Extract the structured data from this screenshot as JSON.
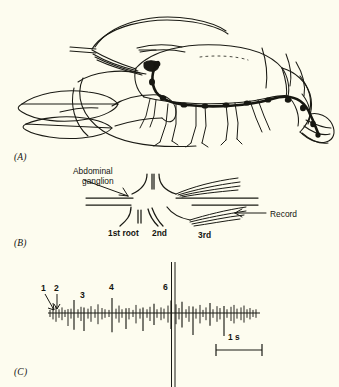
{
  "figure": {
    "background_color": "#fdfcef",
    "ink_color": "#141410",
    "panels": [
      {
        "id": "A",
        "label": "(A)",
        "caption": "lobster with ventral nerve cord"
      },
      {
        "id": "B",
        "label": "(B)",
        "caption": "abdominal ganglion schematic"
      },
      {
        "id": "C",
        "label": "(C)",
        "caption": "extracellular spike recording"
      }
    ]
  },
  "panel_a": {
    "label": "(A)",
    "subject": "lobster-line-drawing",
    "features": [
      "antennae",
      "claw-left",
      "claw-right",
      "carapace",
      "walking-legs",
      "abdomen-segments",
      "tail-fan",
      "ventral-nerve-cord"
    ]
  },
  "panel_b": {
    "label": "(B)",
    "title_label": "Abdominal ganglion",
    "title_line_1": "Abdominal",
    "title_line_2": "ganglion",
    "record_label": "Record",
    "roots": [
      {
        "name": "1st root",
        "label": "1st root"
      },
      {
        "name": "2nd root",
        "label": "2nd"
      },
      {
        "name": "3rd root",
        "label": "3rd"
      }
    ]
  },
  "panel_c": {
    "label": "(C)",
    "scale_bar_label": "1 s",
    "scale_bar_seconds": 1,
    "spike_labels": [
      {
        "text": "1",
        "x": 44,
        "y": 286,
        "arrow": "diagonal"
      },
      {
        "text": "2",
        "x": 55,
        "y": 286,
        "arrow": "vertical"
      },
      {
        "text": "3",
        "x": 82,
        "y": 295,
        "arrow": "none"
      },
      {
        "text": "4",
        "x": 110,
        "y": 288,
        "arrow": "none"
      },
      {
        "text": "6",
        "x": 164,
        "y": 288,
        "arrow": "none"
      }
    ],
    "chart_data": {
      "type": "line",
      "title": "Extracellular spike train from abdominal ganglion root",
      "xlabel": "time",
      "ylabel": "extracellular potential",
      "grid": false,
      "baseline_y": 313,
      "x_range_px": [
        50,
        258
      ],
      "scale_bar": {
        "label": "1 s",
        "x_start": 215,
        "x_end": 262,
        "y": 350
      },
      "stimulus_artifact": {
        "x": 173,
        "label": "6",
        "type": "double-vertical-line",
        "y_top": 262,
        "y_bottom": 387
      },
      "annotations": [
        "1",
        "2",
        "3",
        "4",
        "6"
      ],
      "spikes": [
        {
          "x": 50,
          "amp": 5,
          "dir": "both"
        },
        {
          "x": 53,
          "amp": 8,
          "dir": "both"
        },
        {
          "x": 56,
          "amp": 11,
          "dir": "both"
        },
        {
          "x": 59,
          "amp": 6,
          "dir": "both"
        },
        {
          "x": 62,
          "amp": 9,
          "dir": "both"
        },
        {
          "x": 65,
          "amp": 5,
          "dir": "both"
        },
        {
          "x": 68,
          "amp": 13,
          "dir": "down"
        },
        {
          "x": 71,
          "amp": 7,
          "dir": "both"
        },
        {
          "x": 74,
          "amp": 21,
          "dir": "both"
        },
        {
          "x": 78,
          "amp": 6,
          "dir": "both"
        },
        {
          "x": 81,
          "amp": 10,
          "dir": "both"
        },
        {
          "x": 84,
          "amp": 18,
          "dir": "down"
        },
        {
          "x": 88,
          "amp": 7,
          "dir": "both"
        },
        {
          "x": 91,
          "amp": 11,
          "dir": "both"
        },
        {
          "x": 95,
          "amp": 6,
          "dir": "both"
        },
        {
          "x": 98,
          "amp": 14,
          "dir": "both"
        },
        {
          "x": 102,
          "amp": 8,
          "dir": "both"
        },
        {
          "x": 105,
          "amp": 6,
          "dir": "both"
        },
        {
          "x": 109,
          "amp": 5,
          "dir": "both"
        },
        {
          "x": 112,
          "amp": 24,
          "dir": "both"
        },
        {
          "x": 116,
          "amp": 7,
          "dir": "both"
        },
        {
          "x": 119,
          "amp": 12,
          "dir": "both"
        },
        {
          "x": 122,
          "amp": 6,
          "dir": "both"
        },
        {
          "x": 126,
          "amp": 16,
          "dir": "down"
        },
        {
          "x": 129,
          "amp": 8,
          "dir": "both"
        },
        {
          "x": 133,
          "amp": 5,
          "dir": "both"
        },
        {
          "x": 136,
          "amp": 13,
          "dir": "both"
        },
        {
          "x": 140,
          "amp": 7,
          "dir": "both"
        },
        {
          "x": 143,
          "amp": 18,
          "dir": "down"
        },
        {
          "x": 147,
          "amp": 6,
          "dir": "both"
        },
        {
          "x": 150,
          "amp": 10,
          "dir": "both"
        },
        {
          "x": 154,
          "amp": 15,
          "dir": "both"
        },
        {
          "x": 157,
          "amp": 6,
          "dir": "both"
        },
        {
          "x": 161,
          "amp": 9,
          "dir": "both"
        },
        {
          "x": 164,
          "amp": 7,
          "dir": "both"
        },
        {
          "x": 168,
          "amp": 12,
          "dir": "both"
        },
        {
          "x": 171,
          "amp": 20,
          "dir": "both"
        },
        {
          "x": 176,
          "amp": 14,
          "dir": "both"
        },
        {
          "x": 179,
          "amp": 8,
          "dir": "both"
        },
        {
          "x": 182,
          "amp": 18,
          "dir": "both"
        },
        {
          "x": 186,
          "amp": 6,
          "dir": "both"
        },
        {
          "x": 189,
          "amp": 11,
          "dir": "both"
        },
        {
          "x": 193,
          "amp": 22,
          "dir": "down"
        },
        {
          "x": 196,
          "amp": 7,
          "dir": "both"
        },
        {
          "x": 200,
          "amp": 13,
          "dir": "both"
        },
        {
          "x": 203,
          "amp": 5,
          "dir": "both"
        },
        {
          "x": 206,
          "amp": 9,
          "dir": "both"
        },
        {
          "x": 210,
          "amp": 16,
          "dir": "both"
        },
        {
          "x": 213,
          "amp": 6,
          "dir": "both"
        },
        {
          "x": 217,
          "amp": 11,
          "dir": "both"
        },
        {
          "x": 220,
          "amp": 8,
          "dir": "both"
        },
        {
          "x": 224,
          "amp": 23,
          "dir": "down"
        },
        {
          "x": 227,
          "amp": 6,
          "dir": "both"
        },
        {
          "x": 231,
          "amp": 10,
          "dir": "both"
        },
        {
          "x": 234,
          "amp": 13,
          "dir": "both"
        },
        {
          "x": 237,
          "amp": 7,
          "dir": "both"
        },
        {
          "x": 241,
          "amp": 9,
          "dir": "both"
        },
        {
          "x": 244,
          "amp": 12,
          "dir": "both"
        },
        {
          "x": 247,
          "amp": 6,
          "dir": "both"
        },
        {
          "x": 250,
          "amp": 8,
          "dir": "both"
        },
        {
          "x": 253,
          "amp": 5,
          "dir": "both"
        },
        {
          "x": 256,
          "amp": 6,
          "dir": "both"
        }
      ]
    }
  }
}
